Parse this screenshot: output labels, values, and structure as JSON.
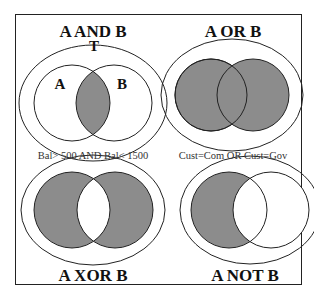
{
  "diagrams": [
    {
      "title": "A AND B",
      "universe_label": "T",
      "set_a_label": "A",
      "set_b_label": "B",
      "shaded": "intersection"
    },
    {
      "title": "A OR B",
      "shaded": "union"
    },
    {
      "title": "A XOR B",
      "shaded": "symmetric-difference"
    },
    {
      "title": "A NOT B",
      "shaded": "a-minus-b"
    }
  ],
  "conditions": {
    "left": "Bal> 500 AND Bal< 1500",
    "right": "Cust=Com OR Cust=Gov"
  },
  "colors": {
    "shade": "#8c8c8c",
    "stroke": "#222222",
    "background": "#ffffff"
  }
}
